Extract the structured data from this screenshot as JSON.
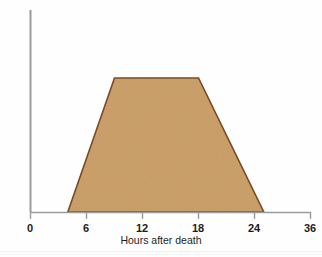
{
  "chart_data": {
    "type": "area",
    "title": "",
    "subtitle": "",
    "xlabel": "Hours after death",
    "ylabel": "Degree of firming",
    "xticklabels": [
      "0",
      "6",
      "12",
      "18",
      "24",
      "36"
    ],
    "xtickvalues": [
      0,
      6,
      12,
      18,
      24,
      36
    ],
    "yticklabels": [],
    "ylim": [
      0,
      100
    ],
    "xlim": [
      0,
      36
    ],
    "grid": false,
    "legend": null,
    "legend_position": "none",
    "series": [
      {
        "name": "Degree of firming",
        "x": [
          4,
          9,
          18,
          25
        ],
        "values": [
          0,
          88,
          88,
          0
        ],
        "fill_color": "#c99c62",
        "line_color": "#7a4a28"
      }
    ],
    "annotations": []
  },
  "axes": {
    "axis_color": "#9b9b9b",
    "tick_color": "#9b9b9b",
    "text_color": "#1d1d1d"
  },
  "colors": {
    "fill": "#c99c62",
    "outline": "#7a4a28",
    "background": "#fefefe",
    "axis": "#9b9b9b"
  }
}
